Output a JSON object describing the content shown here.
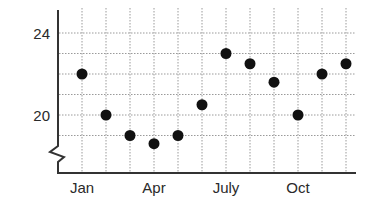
{
  "chart_data": {
    "type": "scatter",
    "title": "",
    "xlabel": "",
    "ylabel": "",
    "categories": [
      "Jan",
      "Feb",
      "Mar",
      "Apr",
      "May",
      "Jun",
      "Jul",
      "Aug",
      "Sep",
      "Oct",
      "Nov",
      "Dec"
    ],
    "x_tick_labels": [
      "Jan",
      "Apr",
      "July",
      "Oct"
    ],
    "y_tick_labels": [
      "24",
      "20"
    ],
    "values": [
      22,
      20,
      19,
      18.6,
      19,
      20.5,
      23,
      22.5,
      21.6,
      20,
      22,
      22.5
    ],
    "ylim": [
      18,
      24.5
    ],
    "y_axis_break": true,
    "grid": true,
    "grid_style": "dotted",
    "legend": null,
    "marker_color": "#111111"
  }
}
